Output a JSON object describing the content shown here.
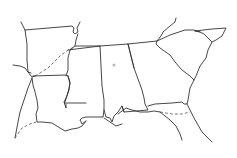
{
  "map": {
    "title": "Southeastern United States outline map",
    "regions": [
      "Arkansas",
      "Louisiana",
      "Mississippi",
      "Alabama",
      "Georgia",
      "South Carolina",
      "Florida",
      "Tennessee"
    ],
    "line_color": "#333333",
    "background_color": "#ffffff",
    "markers": [
      {
        "name": "city-marker",
        "region": "Alabama"
      }
    ]
  }
}
